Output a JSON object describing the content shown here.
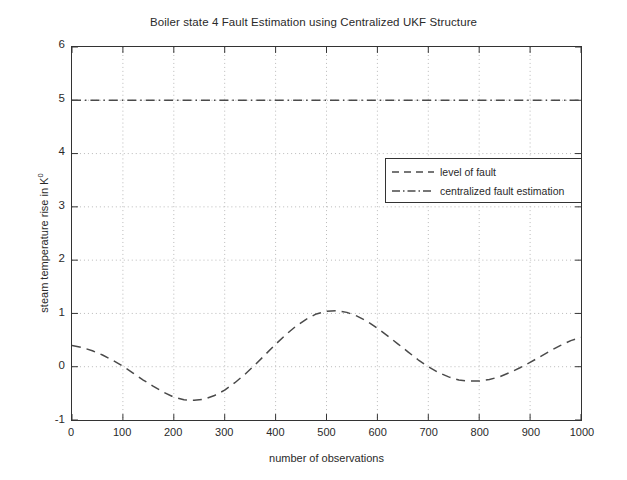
{
  "chart_data": {
    "type": "line",
    "title": "Boiler state 4 Fault Estimation using Centralized UKF Structure",
    "xlabel": "number of observations",
    "ylabel": "steam temperature rise in K",
    "ylabel_superscript": "0",
    "xlim": [
      0,
      1000
    ],
    "ylim": [
      -1,
      6
    ],
    "xticks": [
      0,
      100,
      200,
      300,
      400,
      500,
      600,
      700,
      800,
      900,
      1000
    ],
    "xtick_labels": [
      "0",
      "100",
      "200",
      "300",
      "400",
      "500",
      "600",
      "700",
      "800",
      "900",
      "1000"
    ],
    "yticks": [
      -1,
      0,
      1,
      2,
      3,
      4,
      5,
      6
    ],
    "ytick_labels": [
      "-1",
      "0",
      "1",
      "2",
      "3",
      "4",
      "5",
      "6"
    ],
    "grid": true,
    "grid_style": "dotted",
    "grid_color": "#b9b9b9",
    "legend_position": "center-right",
    "background": "#ffffff",
    "axis_color": "#333333",
    "series": [
      {
        "name": "level of fault",
        "linestyle": "dashed",
        "color": "#4a4a4a",
        "x": [
          0,
          20,
          40,
          60,
          80,
          100,
          120,
          140,
          160,
          180,
          200,
          220,
          240,
          260,
          280,
          300,
          320,
          340,
          360,
          380,
          400,
          420,
          440,
          460,
          480,
          500,
          520,
          540,
          560,
          580,
          600,
          620,
          640,
          660,
          680,
          700,
          720,
          740,
          760,
          780,
          800,
          820,
          840,
          860,
          880,
          900,
          920,
          940,
          960,
          980,
          1000
        ],
        "values": [
          0.4,
          0.36,
          0.3,
          0.22,
          0.12,
          0.01,
          -0.12,
          -0.25,
          -0.37,
          -0.48,
          -0.57,
          -0.62,
          -0.63,
          -0.61,
          -0.54,
          -0.44,
          -0.3,
          -0.14,
          0.04,
          0.23,
          0.42,
          0.6,
          0.76,
          0.89,
          0.99,
          1.04,
          1.05,
          1.02,
          0.95,
          0.85,
          0.72,
          0.58,
          0.43,
          0.28,
          0.13,
          0.0,
          -0.11,
          -0.19,
          -0.25,
          -0.27,
          -0.27,
          -0.24,
          -0.19,
          -0.11,
          -0.02,
          0.08,
          0.19,
          0.3,
          0.4,
          0.49,
          0.55
        ]
      },
      {
        "name": "centralized fault estimation",
        "linestyle": "dashdot",
        "color": "#4a4a4a",
        "x": [
          0,
          1000
        ],
        "values": [
          5.0,
          5.0
        ],
        "constant_level": 5.0
      }
    ]
  },
  "legend": {
    "items": [
      {
        "label": "level of fault",
        "style": "dashed"
      },
      {
        "label": "centralized fault estimation",
        "style": "dashdot"
      }
    ]
  }
}
